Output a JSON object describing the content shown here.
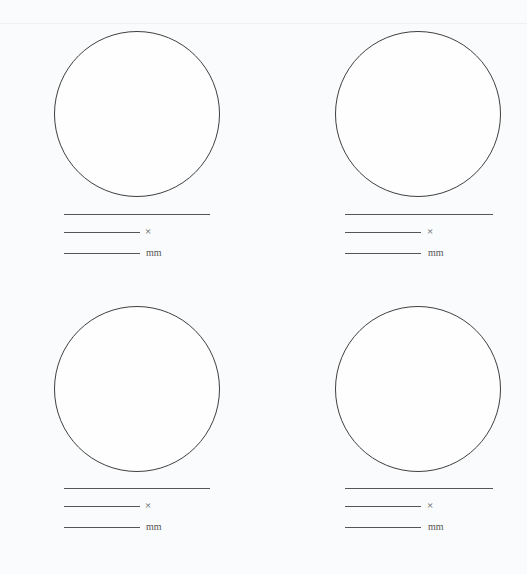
{
  "worksheet": {
    "items": [
      {
        "id": 1,
        "multiply_symbol": "×",
        "unit": "mm"
      },
      {
        "id": 2,
        "multiply_symbol": "×",
        "unit": "mm"
      },
      {
        "id": 3,
        "multiply_symbol": "×",
        "unit": "mm"
      },
      {
        "id": 4,
        "multiply_symbol": "×",
        "unit": "mm"
      }
    ]
  }
}
